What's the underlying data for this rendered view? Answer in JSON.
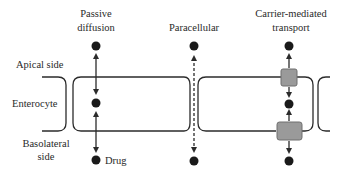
{
  "diagram": {
    "columns": [
      {
        "id": "passive",
        "title_line1": "Passive",
        "title_line2": "diffusion"
      },
      {
        "id": "paracellular",
        "title_line1": "Paracellular"
      },
      {
        "id": "carrier",
        "title_line1": "Carrier-mediated",
        "title_line2": "transport"
      }
    ],
    "side_labels": {
      "apical": "Apical side",
      "enterocyte": "Enterocyte",
      "basolateral_line1": "Basolateral",
      "basolateral_line2": "side"
    },
    "drug_label": "Drug",
    "colors": {
      "line": "#2b2b2b",
      "dot": "#1a1a1a",
      "carrier_fill": "#9a9a9a",
      "carrier_stroke": "#6e6e6e"
    }
  }
}
